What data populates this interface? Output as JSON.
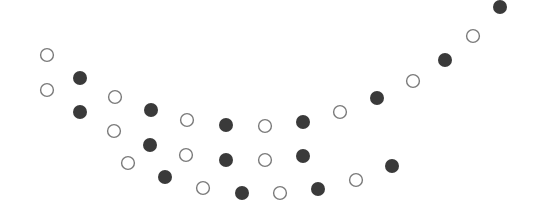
{
  "figure": {
    "width": 548,
    "height": 224,
    "background": "#ffffff",
    "radius": 7,
    "open_stroke": "#7a7a7a",
    "open_fill": "#ffffff",
    "filled_color": "#3a3a3a",
    "dots": [
      {
        "x": 47,
        "y": 55,
        "type": "open"
      },
      {
        "x": 47,
        "y": 90,
        "type": "open"
      },
      {
        "x": 80,
        "y": 78,
        "type": "filled"
      },
      {
        "x": 80,
        "y": 112,
        "type": "filled"
      },
      {
        "x": 115,
        "y": 97,
        "type": "open"
      },
      {
        "x": 114,
        "y": 131,
        "type": "open"
      },
      {
        "x": 128,
        "y": 163,
        "type": "open"
      },
      {
        "x": 151,
        "y": 110,
        "type": "filled"
      },
      {
        "x": 150,
        "y": 145,
        "type": "filled"
      },
      {
        "x": 165,
        "y": 177,
        "type": "filled"
      },
      {
        "x": 187,
        "y": 120,
        "type": "open"
      },
      {
        "x": 186,
        "y": 155,
        "type": "open"
      },
      {
        "x": 203,
        "y": 188,
        "type": "open"
      },
      {
        "x": 226,
        "y": 125,
        "type": "filled"
      },
      {
        "x": 226,
        "y": 160,
        "type": "filled"
      },
      {
        "x": 242,
        "y": 193,
        "type": "filled"
      },
      {
        "x": 265,
        "y": 126,
        "type": "open"
      },
      {
        "x": 265,
        "y": 160,
        "type": "open"
      },
      {
        "x": 280,
        "y": 193,
        "type": "open"
      },
      {
        "x": 303,
        "y": 122,
        "type": "filled"
      },
      {
        "x": 303,
        "y": 156,
        "type": "filled"
      },
      {
        "x": 318,
        "y": 189,
        "type": "filled"
      },
      {
        "x": 340,
        "y": 112,
        "type": "open"
      },
      {
        "x": 356,
        "y": 180,
        "type": "open"
      },
      {
        "x": 377,
        "y": 98,
        "type": "filled"
      },
      {
        "x": 392,
        "y": 166,
        "type": "filled"
      },
      {
        "x": 413,
        "y": 81,
        "type": "open"
      },
      {
        "x": 445,
        "y": 60,
        "type": "filled"
      },
      {
        "x": 473,
        "y": 36,
        "type": "open"
      },
      {
        "x": 500,
        "y": 7,
        "type": "filled"
      }
    ]
  }
}
